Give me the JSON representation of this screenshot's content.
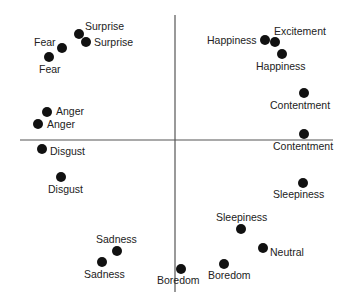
{
  "chart_data": {
    "type": "scatter",
    "title": "",
    "xlabel": "",
    "ylabel": "",
    "grid": false,
    "legend": null,
    "axes": {
      "x_axis_px": {
        "x1": 20,
        "x2": 333,
        "y": 140
      },
      "y_axis_px": {
        "x": 175,
        "y1": 15,
        "y2": 292
      }
    },
    "points": [
      {
        "label": "Surprise",
        "x": 79,
        "y": 34,
        "label_x": 85,
        "label_y": 30,
        "anchor": "start"
      },
      {
        "label": "Surprise",
        "x": 86,
        "y": 42,
        "label_x": 94,
        "label_y": 46,
        "anchor": "start"
      },
      {
        "label": "Fear",
        "x": 62,
        "y": 48,
        "label_x": 34,
        "label_y": 46,
        "anchor": "start"
      },
      {
        "label": "Fear",
        "x": 49,
        "y": 57,
        "label_x": 39,
        "label_y": 73,
        "anchor": "start"
      },
      {
        "label": "Happiness",
        "x": 265,
        "y": 40,
        "label_x": 207,
        "label_y": 44,
        "anchor": "start"
      },
      {
        "label": "Excitement",
        "x": 275,
        "y": 42,
        "label_x": 274,
        "label_y": 35,
        "anchor": "start"
      },
      {
        "label": "Happiness",
        "x": 282,
        "y": 54,
        "label_x": 256,
        "label_y": 70,
        "anchor": "start"
      },
      {
        "label": "Anger",
        "x": 47,
        "y": 112,
        "label_x": 56,
        "label_y": 115,
        "anchor": "start"
      },
      {
        "label": "Anger",
        "x": 38,
        "y": 124,
        "label_x": 47,
        "label_y": 128,
        "anchor": "start"
      },
      {
        "label": "Contentment",
        "x": 304,
        "y": 93,
        "label_x": 270,
        "label_y": 109,
        "anchor": "start"
      },
      {
        "label": "Contentment",
        "x": 304,
        "y": 134,
        "label_x": 273,
        "label_y": 150,
        "anchor": "start"
      },
      {
        "label": "Disgust",
        "x": 42,
        "y": 149,
        "label_x": 50,
        "label_y": 155,
        "anchor": "start"
      },
      {
        "label": "Disgust",
        "x": 61,
        "y": 177,
        "label_x": 48,
        "label_y": 193,
        "anchor": "start"
      },
      {
        "label": "Sleepiness",
        "x": 303,
        "y": 183,
        "label_x": 273,
        "label_y": 198,
        "anchor": "start"
      },
      {
        "label": "Sleepiness",
        "x": 241,
        "y": 229,
        "label_x": 216,
        "label_y": 221,
        "anchor": "start"
      },
      {
        "label": "Neutral",
        "x": 263,
        "y": 248,
        "label_x": 270,
        "label_y": 256,
        "anchor": "start"
      },
      {
        "label": "Sadness",
        "x": 117,
        "y": 251,
        "label_x": 96,
        "label_y": 243,
        "anchor": "start"
      },
      {
        "label": "Sadness",
        "x": 102,
        "y": 262,
        "label_x": 84,
        "label_y": 278,
        "anchor": "start"
      },
      {
        "label": "Boredom",
        "x": 224,
        "y": 264,
        "label_x": 208,
        "label_y": 279,
        "anchor": "start"
      },
      {
        "label": "Boredom",
        "x": 181,
        "y": 269,
        "label_x": 157,
        "label_y": 284,
        "anchor": "start"
      }
    ],
    "point_radius": 5,
    "point_color": "#111111"
  }
}
